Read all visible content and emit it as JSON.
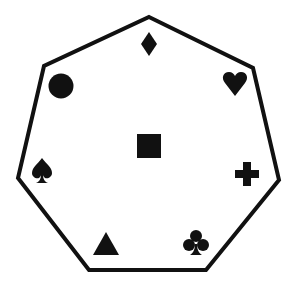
{
  "diagram": {
    "shape": "heptagon",
    "stroke_color": "#111111",
    "fill_color": "#ffffff",
    "symbol_color": "#111111",
    "vertices": [
      [
        149,
        17
      ],
      [
        253,
        68
      ],
      [
        279,
        180
      ],
      [
        206,
        270
      ],
      [
        89,
        270
      ],
      [
        18,
        178
      ],
      [
        44,
        66
      ]
    ],
    "symbols": [
      {
        "name": "diamond",
        "x": 149,
        "y": 44
      },
      {
        "name": "heart",
        "x": 235,
        "y": 83
      },
      {
        "name": "circle",
        "x": 61,
        "y": 86
      },
      {
        "name": "square",
        "x": 149,
        "y": 146
      },
      {
        "name": "spade",
        "x": 42,
        "y": 170
      },
      {
        "name": "plus",
        "x": 247,
        "y": 174
      },
      {
        "name": "triangle",
        "x": 106,
        "y": 243
      },
      {
        "name": "club",
        "x": 196,
        "y": 244
      }
    ]
  }
}
